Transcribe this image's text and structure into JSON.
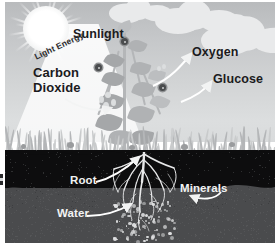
{
  "diagram": {
    "labels": {
      "sunlight": "Sunlight",
      "light_energy": "Light Energy",
      "carbon_dioxide_line1": "Carbon",
      "carbon_dioxide_line2": "Dioxide",
      "oxygen": "Oxygen",
      "glucose": "Glucose",
      "root": "Root",
      "water": "Water",
      "minerals": "Minerals"
    },
    "elements": {
      "sun": "sun-icon",
      "light_cone": "light-beam",
      "clouds": "cloud-shape",
      "plant": "plant-illustration",
      "grass": "grass-line",
      "topsoil": "dark-topsoil-layer",
      "subsoil": "gray-subsoil-layer",
      "roots": "root-system",
      "water_droplets": "water-droplet-cluster"
    },
    "colors": {
      "sky": "#c6c8ca",
      "sun": "#ffffff",
      "light_cone": "#ffffff",
      "topsoil": "#0d0d0e",
      "subsoil": "#4a4b4d",
      "plant": "#b0b2b4",
      "label_dark": "#1b1b1d",
      "label_light": "#f2f3f3"
    },
    "arrows": [
      {
        "name": "carbon-dioxide-arrow",
        "from": "Carbon Dioxide",
        "to": "plant leaves"
      },
      {
        "name": "oxygen-arrow",
        "from": "plant",
        "to": "Oxygen"
      },
      {
        "name": "glucose-arrow",
        "from": "plant",
        "to": "Glucose"
      },
      {
        "name": "root-arrow",
        "from": "Root",
        "to": "root system"
      },
      {
        "name": "water-arrow",
        "from": "Water",
        "to": "root zone"
      },
      {
        "name": "minerals-arrow",
        "from": "Minerals",
        "to": "soil"
      }
    ]
  }
}
